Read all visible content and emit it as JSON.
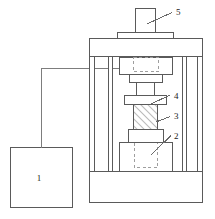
{
  "figure": {
    "type": "technical-line-diagram",
    "stroke_color": "#5a5a5a",
    "hatch_color": "#6a6a6a",
    "dashed_color": "#9a9a9a",
    "background": "#ffffff",
    "width": 215,
    "height": 219
  },
  "callouts": [
    {
      "id": "1",
      "label": "1",
      "name": "control-unit",
      "text_x": 39,
      "text_y": 181
    },
    {
      "id": "2",
      "label": "2",
      "name": "lower-pedestal",
      "text_x": 174,
      "text_y": 139
    },
    {
      "id": "3",
      "label": "3",
      "name": "specimen",
      "text_x": 174,
      "text_y": 119
    },
    {
      "id": "4",
      "label": "4",
      "name": "upper-platen-plate",
      "text_x": 174,
      "text_y": 99
    },
    {
      "id": "5",
      "label": "5",
      "name": "top-piston",
      "text_x": 176,
      "text_y": 15
    }
  ],
  "parts": {
    "control_box": {
      "x": 10,
      "y": 147,
      "w": 63,
      "h": 61
    },
    "wire": {
      "from_x": 41,
      "from_y": 147,
      "corner_y": 68.5,
      "to_x": 121
    },
    "top_piston": {
      "x": 135,
      "y": 8,
      "w": 21,
      "h": 25
    },
    "top_cap": {
      "x": 117,
      "y": 33,
      "w": 57,
      "h": 6
    },
    "top_crossbeam": {
      "x": 89,
      "y": 39,
      "w": 114,
      "h": 18
    },
    "left_outer_column": {
      "x": 89,
      "y": 57,
      "w": 5,
      "h": 115
    },
    "left_inner_column": {
      "x": 108,
      "y": 57,
      "w": 4,
      "h": 115
    },
    "right_inner_column": {
      "x": 183,
      "y": 57,
      "w": 4,
      "h": 115
    },
    "right_outer_column": {
      "x": 198,
      "y": 57,
      "w": 5,
      "h": 115
    },
    "upper_platen": {
      "x": 119,
      "y": 58,
      "w": 53,
      "h": 17
    },
    "upper_platen_dashed": {
      "x": 133,
      "y": 58,
      "w": 25,
      "h": 14
    },
    "upper_block": {
      "x": 129,
      "y": 75,
      "w": 33,
      "h": 8
    },
    "ram_shaft": {
      "x": 136,
      "y": 83,
      "w": 19,
      "h": 13
    },
    "plate_4": {
      "x": 124,
      "y": 96,
      "w": 43,
      "h": 9
    },
    "specimen_3": {
      "x": 133,
      "y": 105,
      "w": 25,
      "h": 25
    },
    "lower_block": {
      "x": 128,
      "y": 130,
      "w": 36,
      "h": 13
    },
    "pedestal_2": {
      "x": 119,
      "y": 143,
      "w": 54,
      "h": 29
    },
    "pedestal_dashed": {
      "x": 134,
      "y": 148,
      "w": 24,
      "h": 24
    },
    "base": {
      "x": 89,
      "y": 172,
      "w": 114,
      "h": 31
    }
  },
  "leaders": [
    {
      "name": "leader-5",
      "x1": 148,
      "y1": 24,
      "x2": 172,
      "y2": 13
    },
    {
      "name": "leader-4",
      "x1": 152,
      "y1": 104,
      "x2": 170,
      "y2": 95
    },
    {
      "name": "leader-3",
      "x1": 155,
      "y1": 122,
      "x2": 170,
      "y2": 117
    },
    {
      "name": "leader-2",
      "x1": 152,
      "y1": 154,
      "x2": 171,
      "y2": 136
    }
  ]
}
